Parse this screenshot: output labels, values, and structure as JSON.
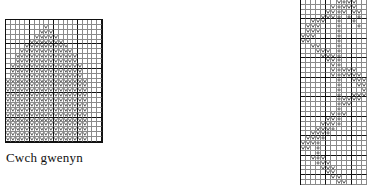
{
  "figure": {
    "type": "knitting-stitch-charts",
    "caption": "Cwch gwenyn",
    "symbol_legend": {
      "V": "v-stitch-symbol",
      "o": "yarn-over-symbol",
      ".": "empty-cell"
    }
  },
  "charts": [
    {
      "id": "chart-left",
      "name": "beehive-chart",
      "caption": "Cwch gwenyn",
      "cols": 20,
      "rows": 25,
      "cell_w": 4.8,
      "cell_h": 4.88,
      "bold_every_col": 5,
      "bold_every_row": 5,
      "rows_data": [
        "....................",
        "........V...........",
        ".......VVV..........",
        "......VVVVV.........",
        ".....VVVVVVV........",
        "....VVVVVVVVV.......",
        "...VVVVVVVVVVV......",
        "..VVVVVVVVVVVVV.....",
        "..VVVVVVVVVVVVV.....",
        ".VVVVVVVVVVVVVVV....",
        ".VVVVVVVVVVVVVVV....",
        ".VVVVVVVVVVVVVVV....",
        "VVVVVVVVVVVVVVVVV...",
        "VVVVVVVVVVVVVVVVV...",
        "VVVVVVVVVVVVVVVVV...",
        "VVVVVVVVVVVVVVVVV...",
        "VVVVVVVVVVVVVVVVV...",
        "VVVVVVVVVVVVVVVVV...",
        "VVVVVVVVVVVVVVVVV...",
        "VVVVVVVVVVVVVVVVV...",
        "VVVVVVVVVVVVVVVVV...",
        "VVVVVVVVVVVVVVVVV...",
        "VVVVVVVVVVVVVVVVV...",
        "VVVVVVVVVVVVVVVVV...",
        "VVVVVVVVVVVVVVVVV..."
      ]
    },
    {
      "id": "chart-right",
      "name": "diagonal-lace-chart",
      "caption": "",
      "cols": 13,
      "rows": 38,
      "cell_w": 5.08,
      "cell_h": 4.87,
      "bold_every_col": 5,
      "bold_every_row": 4,
      "rows_data": [
        ".......VoVV..",
        "......VoVVV..",
        ".....VVoV.VV.",
        "....VVVo.o.o.",
        "..VVV..o..o..",
        ".VVV...o...o.",
        ".VVV...o.....",
        "VVV....o.....",
        "VV.....o.....",
        "..VV...o.....",
        "...VVV.o.....",
        "....VVVo.....",
        ".....VVo.....",
        "......Vo.....",
        "......VoVVV..",
        "......VoVVVV.",
        ".......o..VVV",
        ".......o...VV",
        ".......o....V",
        ".......o..VVV",
        ".......oVVVV.",
        ".......oVV...",
        ".......o.....",
        "......VoV....",
        ".....VVo.....",
        "....VVVo.....",
        "...VVVo......",
        "..VVVo.......",
        ".VVVo........",
        "VVVo.........",
        "VV.o.........",
        "...o.........",
        "..VoV........",
        "...oVV.......",
        "....VVV......",
        ".....VV......",
        "......VV.....",
        ".......VV...."
      ]
    }
  ]
}
